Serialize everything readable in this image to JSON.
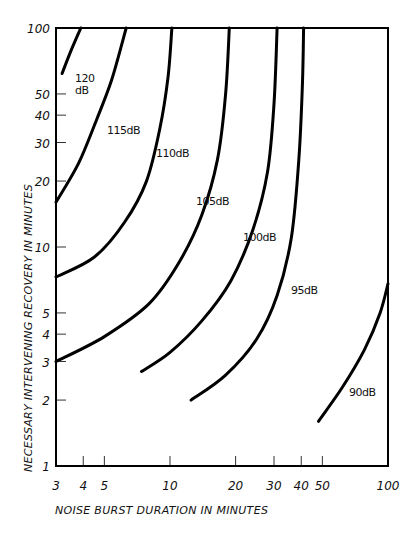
{
  "chart_data": {
    "type": "line",
    "title": "",
    "xlabel": "NOISE BURST DURATION IN MINUTES",
    "ylabel": "NECESSARY INTERVENING RECOVERY IN MINUTES",
    "xscale": "log",
    "yscale": "log",
    "xlim": [
      3,
      100
    ],
    "ylim": [
      1,
      100
    ],
    "grid": false,
    "legend": "none (curves labeled inline)",
    "x_ticks": [
      3,
      4,
      5,
      10,
      20,
      30,
      40,
      50,
      100
    ],
    "x_tick_labels": [
      "3",
      "4",
      "5",
      "10",
      "20",
      "30",
      "40",
      "50",
      "100"
    ],
    "y_ticks": [
      1,
      2,
      3,
      4,
      5,
      10,
      20,
      30,
      40,
      50,
      100
    ],
    "y_tick_labels": [
      "1",
      "2",
      "3",
      "4",
      "5",
      "10",
      "20",
      "30",
      "40",
      "50",
      "100"
    ],
    "series": [
      {
        "name": "120 dB",
        "label": "120\ndB",
        "points": [
          [
            3.2,
            62
          ],
          [
            3.5,
            78
          ],
          [
            3.9,
            100
          ]
        ]
      },
      {
        "name": "115 dB",
        "label": "115dB",
        "points": [
          [
            3,
            16
          ],
          [
            3.8,
            24
          ],
          [
            4.6,
            38
          ],
          [
            5.4,
            58
          ],
          [
            6.3,
            100
          ]
        ]
      },
      {
        "name": "110 dB",
        "label": "110dB",
        "points": [
          [
            3,
            7.3
          ],
          [
            4.5,
            9
          ],
          [
            6.2,
            13
          ],
          [
            7.8,
            20
          ],
          [
            9,
            35
          ],
          [
            9.8,
            60
          ],
          [
            10.2,
            100
          ]
        ]
      },
      {
        "name": "105 dB",
        "label": "105dB",
        "points": [
          [
            3,
            3
          ],
          [
            5,
            3.9
          ],
          [
            8,
            5.5
          ],
          [
            11,
            8.5
          ],
          [
            14,
            14
          ],
          [
            16.5,
            25
          ],
          [
            18,
            50
          ],
          [
            18.7,
            100
          ]
        ]
      },
      {
        "name": "100 dB",
        "label": "100dB",
        "points": [
          [
            7.4,
            2.7
          ],
          [
            10,
            3.3
          ],
          [
            14,
            4.6
          ],
          [
            19,
            7
          ],
          [
            24,
            12
          ],
          [
            28,
            22
          ],
          [
            30,
            45
          ],
          [
            31,
            100
          ]
        ]
      },
      {
        "name": "95 dB",
        "label": "95dB",
        "points": [
          [
            12.5,
            2
          ],
          [
            18,
            2.6
          ],
          [
            25,
            3.8
          ],
          [
            31,
            6
          ],
          [
            36,
            11
          ],
          [
            39,
            25
          ],
          [
            40.5,
            55
          ],
          [
            41,
            100
          ]
        ]
      },
      {
        "name": "90 dB",
        "label": "90dB",
        "points": [
          [
            48,
            1.6
          ],
          [
            62,
            2.3
          ],
          [
            78,
            3.4
          ],
          [
            92,
            5
          ],
          [
            100,
            6.8
          ]
        ]
      }
    ]
  },
  "labels": {
    "x_axis_title": "NOISE BURST DURATION IN MINUTES",
    "y_axis_title": "NECESSARY INTERVENING RECOVERY IN MINUTES",
    "curve_120_line1": "120",
    "curve_120_line2": "dB",
    "curve_115": "115dB",
    "curve_110": "110dB",
    "curve_105": "105dB",
    "curve_100": "100dB",
    "curve_95": "95dB",
    "curve_90": "90dB"
  }
}
